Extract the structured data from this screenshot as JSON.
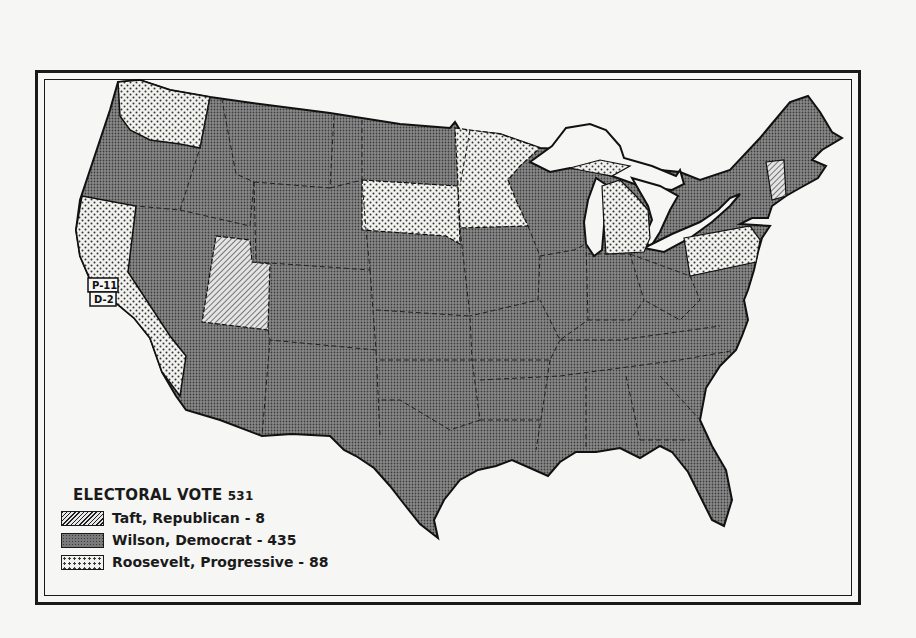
{
  "map": {
    "title": "1912 Presidential Election Map",
    "legend": {
      "title": "ELECTORAL VOTE",
      "total": "531",
      "items": [
        {
          "label": "Taft, Republican - 8",
          "candidate": "Taft",
          "party": "Republican",
          "votes": 8,
          "pattern": "diagonal-hatch"
        },
        {
          "label": "Wilson, Democrat - 435",
          "candidate": "Wilson",
          "party": "Democrat",
          "votes": 435,
          "pattern": "dark-crosshatch"
        },
        {
          "label": "Roosevelt, Progressive - 88",
          "candidate": "Roosevelt",
          "party": "Progressive",
          "votes": 88,
          "pattern": "dots"
        }
      ]
    },
    "split_state_labels": {
      "california_progressive": "P-11",
      "california_democrat": "D-2"
    },
    "states_by_winner": {
      "Taft": [
        "Utah",
        "Vermont"
      ],
      "Roosevelt": [
        "Washington",
        "California",
        "South Dakota",
        "Minnesota",
        "Michigan",
        "Pennsylvania"
      ],
      "Wilson": [
        "all other states"
      ]
    }
  }
}
